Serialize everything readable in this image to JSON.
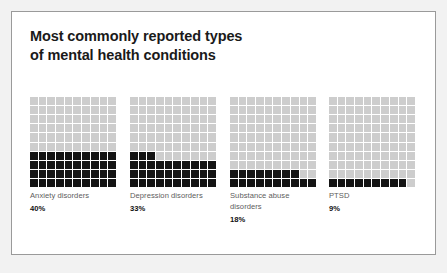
{
  "card": {
    "title_line1": "Most commonly reported types",
    "title_line2": "of mental health conditions",
    "background": "#ffffff",
    "border_color": "#9a9a9a",
    "page_background": "#f2f2f2"
  },
  "colors": {
    "filled_cell": "#141414",
    "empty_cell": "#cdcdcd",
    "category_text": "#5d5d5d",
    "value_text": "#111111",
    "title_text": "#1a1a1a"
  },
  "chart_data": {
    "type": "bar",
    "title": "Most commonly reported types of mental health conditions",
    "subtitle": "",
    "xlabel": "",
    "ylabel": "",
    "categories": [
      "Anxiety disorders",
      "Depression disorders",
      "Substance abuse disorders",
      "PTSD"
    ],
    "values": [
      40,
      33,
      18,
      9
    ],
    "value_labels": [
      "40%",
      "33%",
      "18%",
      "9%"
    ],
    "unit": "%",
    "ylim": [
      0,
      100
    ],
    "grid": false,
    "legend": "none",
    "waffle": {
      "columns": 10,
      "rows": 10,
      "total_cells": 100,
      "fill_order": "bottom-left-to-right"
    }
  },
  "groups": [
    {
      "label": "Anxiety disorders",
      "label_line1": "Anxiety disorders",
      "label_line2": "",
      "percent": "40%",
      "value": 40
    },
    {
      "label": "Depression disorders",
      "label_line1": "Depression disorders",
      "label_line2": "",
      "percent": "33%",
      "value": 33
    },
    {
      "label": "Substance abuse disorders",
      "label_line1": "Substance abuse",
      "label_line2": "disorders",
      "percent": "18%",
      "value": 18
    },
    {
      "label": "PTSD",
      "label_line1": "PTSD",
      "label_line2": "",
      "percent": "9%",
      "value": 9
    }
  ]
}
